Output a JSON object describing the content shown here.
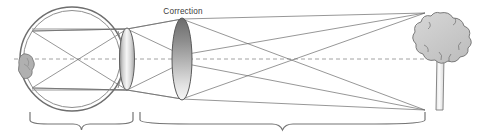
{
  "figure": {
    "width": 486,
    "height": 137,
    "background_color": "#ffffff"
  },
  "labels": {
    "correction": "Correction"
  },
  "colors": {
    "outline": "#6e6e6e",
    "ray": "#6a6a6a",
    "axis": "#8c8c8c",
    "lens_fill_light": "#f2f2f2",
    "lens_fill_mid": "#b9b9b9",
    "lens_fill_dark": "#6b6b6b",
    "tree_fill": "#cbcbcb",
    "tree_outline": "#7a7a7a",
    "trunk_fill": "#f4f4f4",
    "macula_fill": "#b0b0b0",
    "brace": "#757575",
    "text": "#3b3b3b"
  },
  "eye": {
    "name": "human eye cross section",
    "center_x": 72,
    "center_y": 59,
    "radius_outer": 52,
    "radius_inner": 48,
    "macula": {
      "label": "macula",
      "x": 28,
      "y": 68
    },
    "crystalline_lens": {
      "label": "crystalline lens",
      "cx": 127,
      "cy": 59,
      "rx": 7.5,
      "ry": 31
    }
  },
  "correction_lens": {
    "label": "Correction",
    "cx": 182,
    "cy": 59,
    "rx": 10,
    "ry": 41,
    "label_x": 183,
    "label_y": 14
  },
  "optical_axis": {
    "label": "optical axis",
    "x1": 14,
    "x2": 428,
    "y": 59,
    "dash": "4 3"
  },
  "tree": {
    "label": "distant object (tree)",
    "canopy_cx": 443,
    "canopy_cy": 42,
    "canopy_rx": 26,
    "canopy_ry": 28,
    "top_y": 13,
    "base_y": 110,
    "trunk_x1": 436,
    "trunk_x2": 444,
    "trunk_top": 57
  },
  "rays": {
    "label": "light ray paths",
    "object_top": {
      "x": 425,
      "y": 13
    },
    "object_bottom": {
      "x": 425,
      "y": 110
    },
    "eye_lens_top": {
      "x": 127,
      "y": 29
    },
    "eye_lens_bottom": {
      "x": 127,
      "y": 90
    },
    "correction_top": {
      "x": 182,
      "y": 19
    },
    "correction_bottom": {
      "x": 182,
      "y": 99
    },
    "retina_top": {
      "x": 32,
      "y": 31
    },
    "retina_bottom": {
      "x": 32,
      "y": 88
    }
  },
  "braces": [
    {
      "name": "eye-brace",
      "description": "brace spanning the eye",
      "x1": 30,
      "x2": 133,
      "y": 120,
      "depth": 9
    },
    {
      "name": "object-distance-brace",
      "description": "brace spanning lens to object",
      "x1": 140,
      "x2": 425,
      "y": 120,
      "depth": 9
    }
  ]
}
